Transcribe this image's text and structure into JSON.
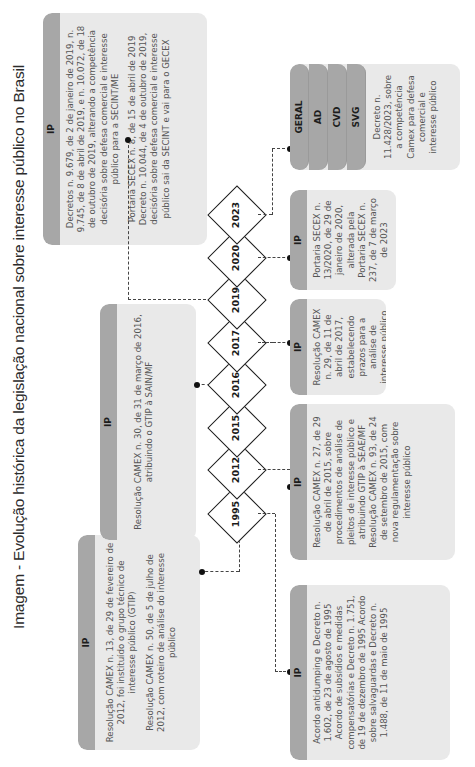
{
  "title": "Imagem - Evolução histórica da legislação nacional sobre interesse público no Brasil",
  "timeline": {
    "years": [
      "1995",
      "2012",
      "2015",
      "2016",
      "2017",
      "2019",
      "2020",
      "2023"
    ]
  },
  "boxes_top": {
    "y2012": {
      "header": "IP",
      "paragraphs": [
        "Resolução CAMEX n. 13, de 29 de fevereiro de 2012, foi instituído o grupo técnico de interesse público (GTIP)",
        "Resolução CAMEX n. 50, de 5 de julho de 2012, com roteiro de análise do interesse público"
      ]
    },
    "y2016": {
      "header": "IP",
      "paragraphs": [
        "Resolução CAMEX n. 30, de 31 de março de 2016, atribuindo o GTIP à SAIN/MF"
      ]
    },
    "y2019": {
      "header": "IP",
      "paragraphs": [
        "Decretos n. 9.679, de 2 de janeiro de 2019, n. 9.745, de 8 de abril de 2019, e n. 10.072, de 18 de outubro de 2019, alterando a competência decisória sobre defesa comercial e interesse público para a SECINT/ME",
        "Portaria SECEX n. 8, de 15 de abril de 2019 Decreto n. 10.044, de 4 de outubro de 2019, decisória sobre defesa comercial e interesse público sai da SECINT e vai para o GECEX"
      ]
    }
  },
  "boxes_bottom": {
    "y1995": {
      "header": "IP",
      "paragraphs": [
        "Acordo antidumping e Decreto n. 1.602, de 23 de agosto de 1995 Acordo de subsídios e medidas compensatórias e Decreto n. 1.751, de 19 de dezembro de 1995 Acordo sobre salvaguardas e Decreto n. 1.488, de 11 de maio de 1995"
      ]
    },
    "y2015": {
      "header": "IP",
      "paragraphs": [
        "Resolução CAMEX n. 27, de 29 de abril de 2015, sobre procedimentos de análise de pleitos de interesse público e atribuindo GTIP à SEAE/MF Resolução CAMEX n. 93, de 24 de setembro de 2015, com nova regulamentação sobre interesse público"
      ]
    },
    "y2017": {
      "header": "IP",
      "paragraphs": [
        "Resolução CAMEX n. 29, de 11 de abril de 2017, estabelecendo prazos para a análise de interesse público"
      ]
    },
    "y2020": {
      "header": "IP",
      "paragraphs": [
        "Portaria SECEX n. 13/2020, de 29 de janeiro de 2020, alterada pela Portaria SECEX n. 237, de 7 de março de 2023"
      ]
    },
    "y2023": {
      "headers": [
        "GERAL",
        "AD",
        "CVD",
        "SVG"
      ],
      "paragraphs": [
        "Decreto n. 11.428/2023, sobre a competência Camex para defesa comercial e interesse público"
      ]
    }
  },
  "colors": {
    "header_gray": "#a7a7a7",
    "body_gray": "#e9e9e9",
    "line": "#1a1a1a"
  }
}
